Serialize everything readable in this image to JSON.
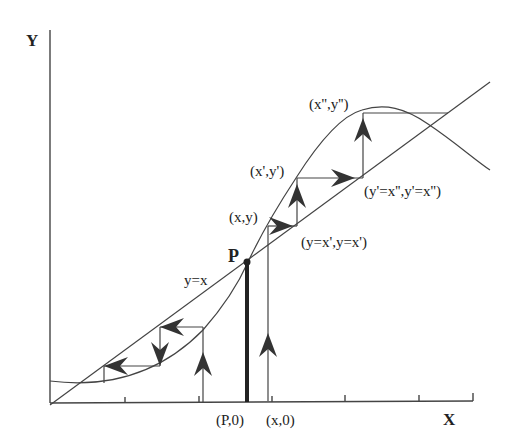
{
  "diagram": {
    "type": "cobweb / staircase iteration diagram",
    "axes": {
      "x_label": "X",
      "y_label": "Y"
    },
    "curves": [
      {
        "name": "diagonal",
        "label": "y=x"
      },
      {
        "name": "map-curve",
        "label": ""
      }
    ],
    "fixed_point": {
      "label": "P",
      "foot_label": "(P,0)"
    },
    "labels": {
      "start_foot": "(x,0)",
      "point_xy": "(x,y)",
      "point_x1y1": "(x',y')",
      "point_x2y2": "(x'',y'')",
      "diag_1": "(y=x',y=x')",
      "diag_2": "(y'=x'',y'=x'')",
      "diagonal": "y=x"
    },
    "colors": {
      "ink": "#333333",
      "background": "#ffffff"
    }
  }
}
